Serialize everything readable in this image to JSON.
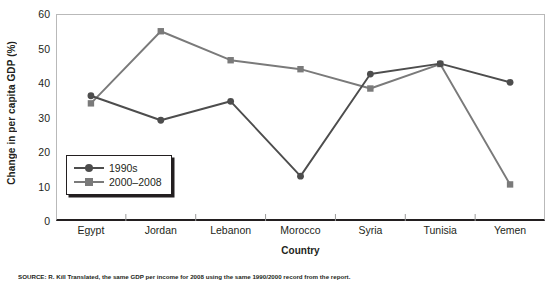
{
  "chart_data": {
    "type": "line",
    "title": "",
    "xlabel": "Country",
    "ylabel": "Change in per capita GDP (%)",
    "categories": [
      "Egypt",
      "Jordan",
      "Lebanon",
      "Morocco",
      "Syria",
      "Tunisia",
      "Yemen"
    ],
    "ylim": [
      0,
      60
    ],
    "yticks": [
      0,
      10,
      20,
      30,
      40,
      50,
      60
    ],
    "ytick_labels": [
      "0",
      "10",
      "20",
      "30",
      "40",
      "50",
      "60"
    ],
    "grid": false,
    "legend_position": "inside-lower-left",
    "series": [
      {
        "name": "1990s",
        "marker": "circle",
        "color": "#4d4d4d",
        "values": [
          36.3,
          29.2,
          34.7,
          13.0,
          42.6,
          45.6,
          40.2
        ]
      },
      {
        "name": "2000–2008",
        "marker": "square",
        "color": "#7a7a7a",
        "values": [
          34.1,
          55.0,
          46.6,
          44.0,
          38.4,
          45.5,
          10.6
        ]
      }
    ]
  },
  "legend": {
    "items": [
      {
        "label": "1990s"
      },
      {
        "label": "2000–2008"
      }
    ]
  },
  "caption": {
    "source_text": "SOURCE: R. Kill Translated, the same GDP per income for 2008 using the same 1990/2000 record from the report."
  },
  "colors": {
    "series_1990s": "#4d4d4d",
    "series_2000_2008": "#7a7a7a",
    "axis": "#231f20",
    "frame": "#b9b9b9",
    "tick": "#9a9a9a",
    "background": "#ffffff"
  }
}
